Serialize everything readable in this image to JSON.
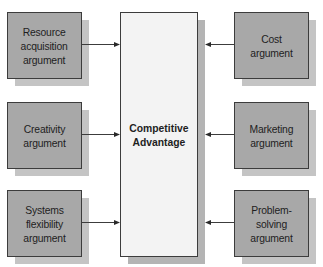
{
  "diagram": {
    "center": {
      "label": "Competitive\nAdvantage"
    },
    "left": [
      {
        "label": "Resource\nacquisition\nargument"
      },
      {
        "label": "Creativity\nargument"
      },
      {
        "label": "Systems\nflexibility\nargument"
      }
    ],
    "right": [
      {
        "label": "Cost\nargument"
      },
      {
        "label": "Marketing\nargument"
      },
      {
        "label": "Problem-\nsolving\nargument"
      }
    ],
    "colors": {
      "box_fill": "#a8a8a8",
      "box_shadow": "#c4c4c4",
      "center_fill": "#f3f3f3",
      "border": "#3c3c3c"
    },
    "edges": [
      {
        "from": "left.0",
        "to": "center"
      },
      {
        "from": "left.1",
        "to": "center"
      },
      {
        "from": "left.2",
        "to": "center"
      },
      {
        "from": "right.0",
        "to": "center"
      },
      {
        "from": "right.1",
        "to": "center"
      },
      {
        "from": "right.2",
        "to": "center"
      }
    ]
  }
}
